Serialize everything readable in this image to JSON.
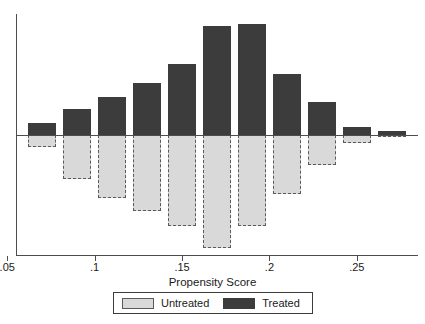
{
  "chart_data": {
    "type": "bar",
    "title": "",
    "subtitle": "",
    "xlabel": "Propensity Score",
    "ylabel": "",
    "orientation": "vertical",
    "style": "back-to-back histogram (treated above axis, untreated below axis)",
    "grid": false,
    "xlim": [
      0.055,
      0.285
    ],
    "ylim": [
      -0.52,
      0.47
    ],
    "xticks": [
      0.05,
      0.1,
      0.15,
      0.2,
      0.25
    ],
    "xtick_labels": [
      ".05",
      ".1",
      ".15",
      ".2",
      ".25"
    ],
    "yticks": [],
    "ytick_labels": [],
    "bin_width": 0.02,
    "bin_centers": [
      0.07,
      0.09,
      0.11,
      0.13,
      0.15,
      0.17,
      0.19,
      0.21,
      0.23,
      0.25,
      0.27
    ],
    "bin_edges": [
      0.06,
      0.08,
      0.1,
      0.12,
      0.14,
      0.16,
      0.18,
      0.2,
      0.22,
      0.24,
      0.26,
      0.28
    ],
    "series": [
      {
        "name": "Treated",
        "color": "#3c3c3c",
        "direction": "up",
        "values": [
          0.05,
          0.11,
          0.16,
          0.22,
          0.3,
          0.46,
          0.47,
          0.26,
          0.14,
          0.033,
          0.017
        ]
      },
      {
        "name": "Untreated",
        "color": "#d9d9d9",
        "direction": "down",
        "values": [
          0.05,
          0.185,
          0.26,
          0.315,
          0.38,
          0.47,
          0.38,
          0.245,
          0.125,
          0.033,
          0.008
        ]
      }
    ],
    "legend": {
      "position": "below-axis-centered",
      "entries": [
        {
          "label": "Untreated",
          "swatch": "light-gray-dashed"
        },
        {
          "label": "Treated",
          "swatch": "dark-gray-solid"
        }
      ]
    },
    "colors": {
      "treated": "#3c3c3c",
      "untreated": "#d9d9d9",
      "untreated_border": "#5a5a5a",
      "axis": "#4d4d4d",
      "text": "#1a1a1a",
      "background": "#ffffff"
    }
  },
  "axis": {
    "x_title": "Propensity Score",
    "tick_labels": [
      ".05",
      ".1",
      ".15",
      ".2",
      ".25"
    ]
  },
  "legend": {
    "untreated_label": "Untreated",
    "treated_label": "Treated"
  }
}
